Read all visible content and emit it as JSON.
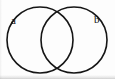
{
  "figure": {
    "kind": "venn-diagram",
    "canvas": {
      "width": 115,
      "height": 79,
      "background_color": "#fdfdfd"
    },
    "stroke": {
      "color": "#151515",
      "width": 1.6
    },
    "circles": [
      {
        "id": "left",
        "label": "a",
        "center_x": 40,
        "center_y": 40,
        "radius": 33
      },
      {
        "id": "right",
        "label": "b",
        "center_x": 74,
        "center_y": 40,
        "radius": 33
      }
    ],
    "intersection_points": [
      {
        "x": 57,
        "y": 12
      },
      {
        "x": 57,
        "y": 68
      }
    ],
    "labels": [
      {
        "id": "a",
        "text": "a",
        "x": 15,
        "y": 21,
        "color": "#101010"
      },
      {
        "id": "b",
        "text": "b",
        "x": 98,
        "y": 20,
        "color": "#101010"
      }
    ],
    "artifacts": {
      "bottom_scan_band": "light gray scan edge along bottom",
      "left_scan_band": "faint gray scan edge along left"
    }
  }
}
